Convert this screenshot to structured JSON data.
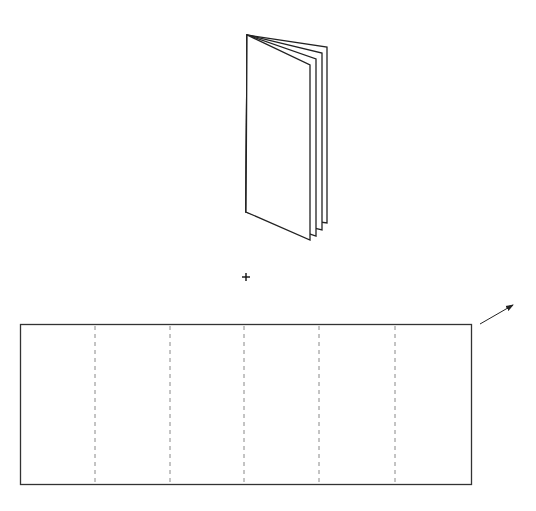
{
  "diagram": {
    "booklet": {
      "panel_count": 4,
      "apex": [
        247,
        35
      ],
      "panels": [
        {
          "x": 327,
          "top": 47,
          "bottom": 223
        },
        {
          "x": 322,
          "top": 53,
          "bottom": 230
        },
        {
          "x": 316,
          "top": 59,
          "bottom": 236
        },
        {
          "x": 310,
          "top": 65,
          "bottom": 240
        }
      ],
      "front_left_bottom": [
        246,
        212
      ]
    },
    "operator": {
      "symbol": "+",
      "center": [
        246,
        277
      ]
    },
    "sheet": {
      "x": 20,
      "y": 324,
      "width": 451,
      "height": 160,
      "fold_lines_x": [
        95,
        170,
        244,
        319,
        395
      ],
      "fold_style": "dashed",
      "panel_count": 6
    },
    "arrow": {
      "from": [
        480,
        324
      ],
      "to": [
        513,
        305
      ],
      "direction": "up-right"
    },
    "colors": {
      "stroke": "#222222",
      "fold_line": "#888888",
      "background": "#ffffff"
    }
  }
}
